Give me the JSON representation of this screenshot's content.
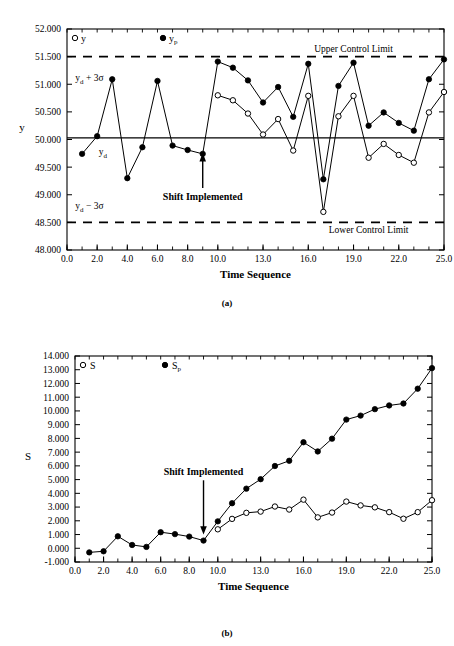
{
  "figure": {
    "panel_a_label": "(a)",
    "panel_b_label": "(b)"
  },
  "chart_data": [
    {
      "id": "panel-a",
      "type": "line",
      "title": "",
      "xlabel": "Time Sequence",
      "ylabel": "y",
      "xlim": [
        0.0,
        25.0
      ],
      "ylim": [
        48.0,
        52.0
      ],
      "grid": false,
      "legend_position": "top-inside",
      "xticks": [
        "0.0",
        "2.0",
        "4.0",
        "6.0",
        "8.0",
        "10.0",
        "13.0",
        "16.0",
        "19.0",
        "22.0",
        "25.0"
      ],
      "xtick_values": [
        0,
        2,
        4,
        6,
        8,
        10,
        13,
        16,
        19,
        22,
        25
      ],
      "yticks": [
        "48.000",
        "48.500",
        "49.000",
        "49.500",
        "50.000",
        "50.500",
        "51.000",
        "51.500",
        "52.000"
      ],
      "ytick_values": [
        48.0,
        48.5,
        49.0,
        49.5,
        50.0,
        50.5,
        51.0,
        51.5,
        52.0
      ],
      "x": [
        1,
        2,
        3,
        4,
        5,
        6,
        7,
        8,
        9,
        10,
        11,
        12,
        13,
        14,
        15,
        16,
        17,
        18,
        19,
        20,
        21,
        22,
        23,
        24,
        25
      ],
      "series": [
        {
          "name": "y_p",
          "marker": "filled-circle",
          "values": [
            49.74,
            50.06,
            51.09,
            49.3,
            49.86,
            51.06,
            49.89,
            49.81,
            49.74,
            51.41,
            51.3,
            51.07,
            50.67,
            50.95,
            50.41,
            51.37,
            49.28,
            50.97,
            51.39,
            50.25,
            50.49,
            50.3,
            50.16,
            51.09,
            51.45
          ]
        },
        {
          "name": "y",
          "marker": "open-circle",
          "values": [
            50.8,
            50.71,
            50.47,
            50.09,
            50.37,
            49.8,
            50.79,
            48.69,
            50.42,
            50.79,
            49.67,
            49.92,
            49.72,
            49.58,
            50.49,
            50.86
          ],
          "x": [
            10,
            11,
            12,
            13,
            14,
            15,
            16,
            17,
            18,
            19,
            20,
            21,
            22,
            23,
            24,
            25
          ]
        }
      ],
      "reference_lines": [
        {
          "label": "Upper Control Limit",
          "value": 51.5,
          "style": "dashed",
          "secondary_label": "y_d + 3σ"
        },
        {
          "label": "",
          "value": 50.03,
          "style": "solid",
          "secondary_label": "y_d"
        },
        {
          "label": "Lower Control Limit",
          "value": 48.5,
          "style": "dashed",
          "secondary_label": "y_d − 3σ"
        }
      ],
      "annotations": [
        {
          "text": "Shift Implemented",
          "x": 9,
          "y": 49.0,
          "arrow": true
        },
        {
          "text": "Upper Control Limit",
          "x": 19,
          "y": 51.66
        },
        {
          "text": "Lower Control Limit",
          "x": 20,
          "y": 48.34
        },
        {
          "text": "y_d + 3σ",
          "x": 1.4,
          "y": 51.17
        },
        {
          "text": "y_d",
          "x": 2.7,
          "y": 49.8
        },
        {
          "text": "y_d − 3σ",
          "x": 1.4,
          "y": 48.73
        }
      ],
      "legend": [
        {
          "label": "y",
          "marker": "open-circle"
        },
        {
          "label": "y_p",
          "marker": "filled-circle"
        }
      ]
    },
    {
      "id": "panel-b",
      "type": "line",
      "title": "",
      "xlabel": "Time Sequence",
      "ylabel": "S",
      "xlim": [
        0.0,
        25.0
      ],
      "ylim": [
        -1.0,
        14.0
      ],
      "grid": false,
      "legend_position": "top-inside",
      "xticks": [
        "0.0",
        "2.0",
        "4.0",
        "6.0",
        "8.0",
        "10.0",
        "13.0",
        "16.0",
        "19.0",
        "22.0",
        "25.0"
      ],
      "xtick_values": [
        0,
        2,
        4,
        6,
        8,
        10,
        13,
        16,
        19,
        22,
        25
      ],
      "yticks": [
        "-1.000",
        "0.000",
        "1.000",
        "2.000",
        "3.000",
        "4.000",
        "5.000",
        "6.000",
        "7.000",
        "8.000",
        "9.000",
        "10.000",
        "11.000",
        "12.000",
        "13.000",
        "14.000"
      ],
      "ytick_values": [
        -1,
        0,
        1,
        2,
        3,
        4,
        5,
        6,
        7,
        8,
        9,
        10,
        11,
        12,
        13,
        14
      ],
      "x": [
        1,
        2,
        3,
        4,
        5,
        6,
        7,
        8,
        9,
        10,
        11,
        12,
        13,
        14,
        15,
        16,
        17,
        18,
        19,
        20,
        21,
        22,
        23,
        24,
        25
      ],
      "series": [
        {
          "name": "S_p",
          "marker": "filled-circle",
          "values": [
            -0.3,
            -0.22,
            0.87,
            0.24,
            0.1,
            1.17,
            1.03,
            0.85,
            0.56,
            1.96,
            3.28,
            4.34,
            5.03,
            5.99,
            6.37,
            7.72,
            7.05,
            7.98,
            9.37,
            9.66,
            10.13,
            10.4,
            10.54,
            11.62,
            13.12
          ]
        },
        {
          "name": "S",
          "marker": "open-circle",
          "values": [
            1.38,
            2.14,
            2.58,
            2.67,
            3.04,
            2.82,
            3.54,
            2.25,
            2.6,
            3.4,
            3.12,
            2.98,
            2.63,
            2.15,
            2.63,
            3.5
          ],
          "x": [
            10,
            11,
            12,
            13,
            14,
            15,
            16,
            17,
            18,
            19,
            20,
            21,
            22,
            23,
            24,
            25
          ]
        }
      ],
      "annotations": [
        {
          "text": "Shift Implemented",
          "x": 9,
          "y": 5.6,
          "arrow": true
        }
      ],
      "legend": [
        {
          "label": "S",
          "marker": "open-circle"
        },
        {
          "label": "S_p",
          "marker": "filled-circle"
        }
      ]
    }
  ]
}
